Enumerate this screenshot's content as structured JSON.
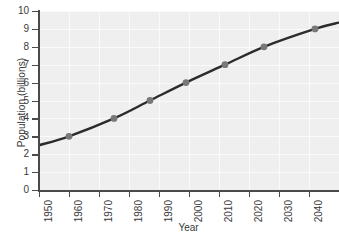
{
  "chart_data": {
    "type": "line",
    "title": "",
    "xlabel": "Year",
    "ylabel": "Population (billions)",
    "xlim": [
      1950,
      2050
    ],
    "ylim": [
      0,
      10
    ],
    "grid": true,
    "legend": null,
    "xticks": [
      "1950",
      "1960",
      "1970",
      "1980",
      "1990",
      "2000",
      "2010",
      "2020",
      "2030",
      "2040",
      "2050"
    ],
    "xtick_values": [
      1950,
      1960,
      1970,
      1980,
      1990,
      2000,
      2010,
      2020,
      2030,
      2040,
      2050
    ],
    "yticks": [
      "0",
      "1",
      "2",
      "3",
      "4",
      "5",
      "6",
      "7",
      "8",
      "9",
      "10"
    ],
    "ytick_values": [
      0,
      1,
      2,
      3,
      4,
      5,
      6,
      7,
      8,
      9,
      10
    ],
    "line_color": "#2b2b2b",
    "marker_color": "#77787a",
    "panel_color": "#efefef",
    "grid_color": "#fafafa",
    "series": [
      {
        "name": "World population",
        "x": [
          1950,
          1960,
          1975,
          1987,
          1999,
          2012,
          2025,
          2042,
          2050
        ],
        "y": [
          2.5,
          3.0,
          4.0,
          5.0,
          6.0,
          7.0,
          8.0,
          9.0,
          9.35
        ],
        "markers_x": [
          1960,
          1975,
          1987,
          1999,
          2012,
          2025,
          2042
        ],
        "markers_y": [
          3,
          4,
          5,
          6,
          7,
          8,
          9
        ]
      }
    ]
  }
}
